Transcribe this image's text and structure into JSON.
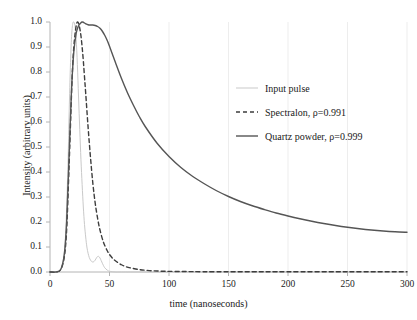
{
  "chart_data": {
    "type": "line",
    "title": "",
    "xlabel": "time (nanoseconds)",
    "ylabel": "Intensity (arbitrary units)",
    "xlim": [
      0,
      300
    ],
    "ylim": [
      0.0,
      1.0
    ],
    "grid": "faint-vertical",
    "legend_position": "center-right",
    "xticks": [
      "0",
      "50",
      "100",
      "150",
      "200",
      "250",
      "300"
    ],
    "xtick_values": [
      0,
      50,
      100,
      150,
      200,
      250,
      300
    ],
    "yticks": [
      "0.0",
      "0.1",
      "0.2",
      "0.3",
      "0.4",
      "0.5",
      "0.6",
      "0.7",
      "0.8",
      "0.9",
      "1.0"
    ],
    "ytick_values": [
      0.0,
      0.1,
      0.2,
      0.3,
      0.4,
      0.5,
      0.6,
      0.7,
      0.8,
      0.9,
      1.0
    ],
    "series": [
      {
        "name": "Input pulse",
        "color": "#c9c9c9",
        "dash": "none",
        "width": 1.0,
        "x": [
          0,
          5,
          9,
          11,
          13,
          15,
          16,
          17,
          18,
          19,
          20,
          21,
          22,
          23,
          24,
          25,
          26,
          27,
          28,
          29,
          30,
          31,
          32,
          33,
          34,
          35,
          36,
          37,
          38,
          39,
          40,
          41,
          42,
          43,
          44,
          45,
          46,
          48,
          50,
          55,
          60,
          80,
          120,
          200,
          300
        ],
        "y": [
          0.0,
          0.0,
          0.01,
          0.04,
          0.14,
          0.41,
          0.62,
          0.8,
          0.93,
          0.99,
          1.0,
          0.985,
          0.93,
          0.83,
          0.7,
          0.57,
          0.45,
          0.35,
          0.26,
          0.19,
          0.14,
          0.1,
          0.075,
          0.058,
          0.048,
          0.042,
          0.04,
          0.042,
          0.048,
          0.056,
          0.062,
          0.062,
          0.056,
          0.046,
          0.035,
          0.025,
          0.017,
          0.008,
          0.003,
          0.0,
          0.0,
          0.0,
          0.0,
          0.0,
          0.0
        ]
      },
      {
        "name": "Spectralon, ρ=0.991",
        "color": "#3d3d3d",
        "dash": "dashed",
        "width": 1.4,
        "x": [
          0,
          5,
          9,
          12,
          14,
          16,
          18,
          19,
          20,
          21,
          22,
          23,
          24,
          25,
          26,
          27,
          28,
          29,
          30,
          32,
          34,
          36,
          38,
          40,
          42,
          45,
          48,
          50,
          53,
          56,
          60,
          64,
          68,
          72,
          76,
          80,
          85,
          90,
          95,
          100,
          110,
          120,
          140,
          170,
          200,
          250,
          300
        ],
        "y": [
          0.0,
          0.0,
          0.01,
          0.06,
          0.17,
          0.42,
          0.7,
          0.82,
          0.9,
          0.95,
          0.985,
          1.0,
          0.995,
          0.975,
          0.945,
          0.9,
          0.845,
          0.78,
          0.715,
          0.58,
          0.46,
          0.355,
          0.275,
          0.215,
          0.168,
          0.118,
          0.086,
          0.07,
          0.053,
          0.041,
          0.029,
          0.021,
          0.016,
          0.012,
          0.009,
          0.007,
          0.005,
          0.004,
          0.003,
          0.0025,
          0.002,
          0.0015,
          0.001,
          0.001,
          0.001,
          0.001,
          0.001
        ]
      },
      {
        "name": "Quartz powder, ρ=0.999",
        "color": "#555555",
        "dash": "none",
        "width": 1.4,
        "x": [
          0,
          5,
          9,
          12,
          14,
          16,
          18,
          20,
          22,
          24,
          26,
          27,
          28,
          29,
          30,
          32,
          34,
          36,
          38,
          40,
          42,
          44,
          46,
          48,
          50,
          55,
          60,
          65,
          70,
          75,
          80,
          90,
          100,
          110,
          120,
          130,
          140,
          150,
          160,
          170,
          180,
          190,
          200,
          210,
          220,
          230,
          240,
          250,
          260,
          270,
          280,
          290,
          300
        ],
        "y": [
          0.0,
          0.0,
          0.01,
          0.07,
          0.2,
          0.46,
          0.72,
          0.88,
          0.955,
          0.985,
          0.997,
          1.0,
          0.999,
          0.996,
          0.993,
          0.989,
          0.988,
          0.988,
          0.986,
          0.982,
          0.975,
          0.963,
          0.947,
          0.927,
          0.903,
          0.838,
          0.775,
          0.718,
          0.668,
          0.622,
          0.582,
          0.515,
          0.462,
          0.418,
          0.382,
          0.352,
          0.325,
          0.302,
          0.282,
          0.265,
          0.25,
          0.236,
          0.224,
          0.213,
          0.203,
          0.194,
          0.186,
          0.179,
          0.173,
          0.168,
          0.164,
          0.161,
          0.159
        ]
      }
    ]
  },
  "axes": {
    "ylabel": "Intensity (arbitrary units)",
    "xlabel": "time (nanoseconds)",
    "ytick_labels": [
      "1.0",
      "0.9",
      "0.8",
      "0.7",
      "0.6",
      "0.5",
      "0.4",
      "0.3",
      "0.2",
      "0.1",
      "0.0"
    ],
    "xtick_labels": [
      "0",
      "50",
      "100",
      "150",
      "200",
      "250",
      "300"
    ]
  },
  "legend": {
    "items": [
      {
        "label": "Input pulse"
      },
      {
        "label": "Spectralon, ρ=0.991"
      },
      {
        "label": "Quartz powder, ρ=0.999"
      }
    ]
  },
  "colors": {
    "input_pulse": "#c9c9c9",
    "spectralon": "#3d3d3d",
    "quartz_powder": "#555555",
    "axis": "#b4b4b4",
    "gridline": "#ededed"
  }
}
